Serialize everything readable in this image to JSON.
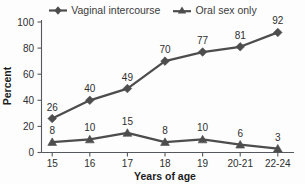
{
  "chart_data": {
    "type": "line",
    "title": "",
    "xlabel": "Years of age",
    "ylabel": "Percent",
    "categories": [
      "15",
      "16",
      "17",
      "18",
      "19",
      "20-21",
      "22-24"
    ],
    "series": [
      {
        "name": "Vaginal intercourse",
        "marker": "diamond",
        "color": "#4d4d4d",
        "values": [
          26,
          40,
          49,
          70,
          77,
          81,
          92
        ]
      },
      {
        "name": "Oral sex only",
        "marker": "triangle",
        "color": "#4d4d4d",
        "values": [
          8,
          10,
          15,
          8,
          10,
          6,
          3
        ]
      }
    ],
    "ylim": [
      0,
      100
    ],
    "yticks": [
      0,
      20,
      40,
      60,
      80,
      100
    ],
    "grid": false,
    "legend_position": "top",
    "data_labels": true
  },
  "legend": {
    "entries": [
      {
        "label": "Vaginal intercourse",
        "marker": "diamond-marker-icon"
      },
      {
        "label": "Oral sex only",
        "marker": "triangle-marker-icon"
      }
    ]
  },
  "axes": {
    "y_title": "Percent",
    "x_title": "Years of age",
    "y_tick_labels": [
      "100",
      "80",
      "60",
      "40",
      "20",
      "0"
    ],
    "x_tick_labels": [
      "15",
      "16",
      "17",
      "18",
      "19",
      "20-21",
      "22-24"
    ]
  },
  "labels": {
    "vaginal": [
      "26",
      "40",
      "49",
      "70",
      "77",
      "81",
      "92"
    ],
    "oral": [
      "8",
      "10",
      "15",
      "8",
      "10",
      "6",
      "3"
    ]
  }
}
